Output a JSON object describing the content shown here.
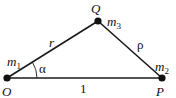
{
  "diagram": {
    "type": "three-body triangle",
    "colors": {
      "stroke": "#1a1a1a",
      "text": "#111111",
      "background": "#ffffff"
    },
    "points": {
      "O": {
        "label": "O",
        "mass_label": "m",
        "mass_sub": "1",
        "x": 7,
        "y": 78
      },
      "P": {
        "label": "P",
        "mass_label": "m",
        "mass_sub": "2",
        "x": 162,
        "y": 78
      },
      "Q": {
        "label": "Q",
        "mass_label": "m",
        "mass_sub": "3",
        "x": 98,
        "y": 21
      }
    },
    "edges": {
      "OQ": {
        "label": "r"
      },
      "QP": {
        "label": "ρ"
      },
      "OP": {
        "label": "1"
      }
    },
    "angle": {
      "label": "α",
      "at": "O"
    }
  }
}
